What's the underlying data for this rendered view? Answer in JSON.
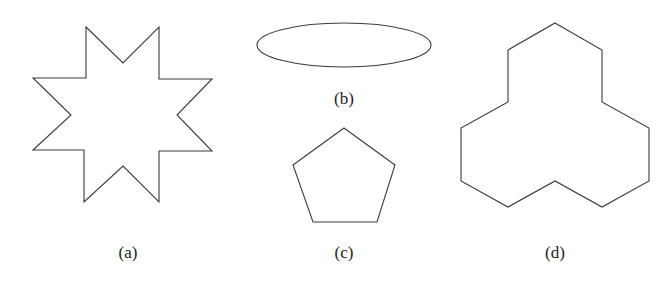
{
  "figure": {
    "panels": [
      {
        "id": "a",
        "label": "(a)",
        "shape": "eight-pointed star"
      },
      {
        "id": "b",
        "label": "(b)",
        "shape": "ellipse"
      },
      {
        "id": "c",
        "label": "(c)",
        "shape": "regular pentagon"
      },
      {
        "id": "d",
        "label": "(d)",
        "shape": "three-lobed dodecagon"
      }
    ],
    "stroke_color": "#3a3a3a",
    "background": "#ffffff"
  }
}
